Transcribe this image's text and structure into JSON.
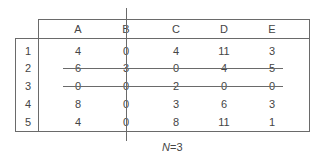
{
  "table": {
    "columns": [
      "A",
      "B",
      "C",
      "D",
      "E"
    ],
    "rows": [
      {
        "label": "1",
        "values": [
          "4",
          "0",
          "4",
          "11",
          "3"
        ],
        "struck": false
      },
      {
        "label": "2",
        "values": [
          "6",
          "3",
          "0",
          "4",
          "5"
        ],
        "struck": true
      },
      {
        "label": "3",
        "values": [
          "0",
          "0",
          "2",
          "0",
          "0"
        ],
        "struck": true
      },
      {
        "label": "4",
        "values": [
          "8",
          "0",
          "3",
          "6",
          "3"
        ],
        "struck": false
      },
      {
        "label": "5",
        "values": [
          "4",
          "0",
          "8",
          "11",
          "1"
        ],
        "struck": false
      }
    ],
    "struck_column": "B"
  },
  "caption": {
    "variable": "N",
    "equals": "=3"
  },
  "colors": {
    "line": "#6a6a6a",
    "text": "#454545"
  }
}
